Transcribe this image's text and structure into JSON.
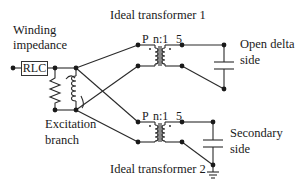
{
  "labels": {
    "winding_impedance_line1": "Winding",
    "winding_impedance_line2": "impedance",
    "rlc": "RLC",
    "excitation_branch_line1": "Excitation",
    "excitation_branch_line2": "branch",
    "ideal_transformer_1": "Ideal transformer 1",
    "ideal_transformer_2": "Ideal transformer 2",
    "open_delta_line1": "Open delta",
    "open_delta_line2": "side",
    "secondary_line1": "Secondary",
    "secondary_line2": "side"
  },
  "transformer_1": {
    "primary_terminal": "P",
    "ratio": "n:1",
    "secondary_terminal": "5"
  },
  "transformer_2": {
    "primary_terminal": "P",
    "ratio": "n:1",
    "secondary_terminal": "5"
  },
  "colors": {
    "line": "#2a2a2a",
    "background": "#ffffff"
  }
}
